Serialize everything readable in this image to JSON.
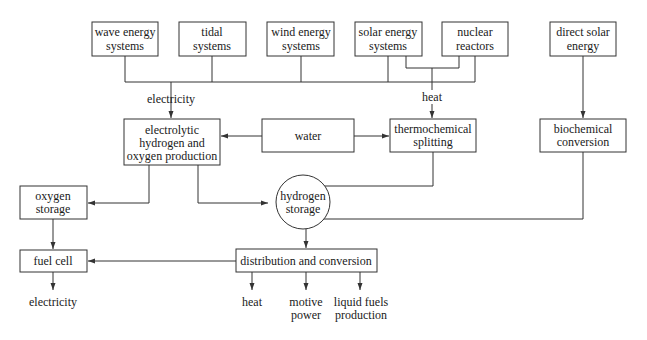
{
  "diagram": {
    "nodes": {
      "wave": {
        "lines": [
          "wave energy",
          "systems"
        ]
      },
      "tidal": {
        "lines": [
          "tidal",
          "systems"
        ]
      },
      "wind": {
        "lines": [
          "wind energy",
          "systems"
        ]
      },
      "solar": {
        "lines": [
          "solar energy",
          "systems"
        ]
      },
      "nuclear": {
        "lines": [
          "nuclear",
          "reactors"
        ]
      },
      "direct_solar": {
        "lines": [
          "direct solar",
          "energy"
        ]
      },
      "electrolytic": {
        "lines": [
          "electrolytic",
          "hydrogen and",
          "oxygen production"
        ]
      },
      "water": {
        "lines": [
          "water"
        ]
      },
      "thermochemical": {
        "lines": [
          "thermochemical",
          "splitting"
        ]
      },
      "biochemical": {
        "lines": [
          "biochemical",
          "conversion"
        ]
      },
      "oxygen_storage": {
        "lines": [
          "oxygen",
          "storage"
        ]
      },
      "hydrogen_storage": {
        "lines": [
          "hydrogen",
          "storage"
        ]
      },
      "fuel_cell": {
        "lines": [
          "fuel cell"
        ]
      },
      "distribution": {
        "lines": [
          "distribution and conversion"
        ]
      }
    },
    "labels": {
      "electricity_in": "electricity",
      "heat_in": "heat",
      "electricity_out": "electricity",
      "heat_out": "heat",
      "motive_power": [
        "motive",
        "power"
      ],
      "liquid_fuels": [
        "liquid fuels",
        "production"
      ]
    },
    "colors": {
      "stroke": "#333333",
      "text": "#1a1a1a",
      "background": "#ffffff"
    }
  }
}
